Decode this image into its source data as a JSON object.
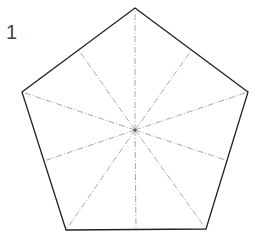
{
  "figure": {
    "label": "1",
    "shape": "regular pentagon",
    "center": [
      135,
      130
    ],
    "vertices": [
      [
        135,
        8
      ],
      [
        248,
        92
      ],
      [
        206,
        229
      ],
      [
        66,
        230
      ],
      [
        22,
        92
      ]
    ],
    "edge_color": "#222222",
    "guide_color": "#aaaaaa",
    "guide_lines": "dash-dot lines from center to each vertex and to each edge midpoint"
  }
}
